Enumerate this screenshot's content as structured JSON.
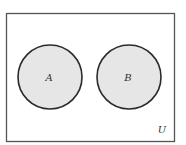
{
  "diagram": {
    "type": "venn",
    "universe_label": "U",
    "sets": [
      {
        "id": "A",
        "label": "A",
        "shaded": true
      },
      {
        "id": "B",
        "label": "B",
        "shaded": true
      }
    ],
    "relationship": "disjoint",
    "colors": {
      "fill": "#e6e6e6",
      "stroke": "#2a2a2a",
      "background": "#ffffff"
    }
  }
}
